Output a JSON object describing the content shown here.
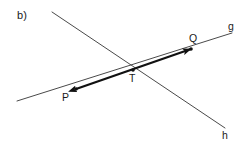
{
  "figure": {
    "part_label": "b)",
    "background_color": "#ffffff",
    "ink_color": "#262626",
    "thin_stroke_color": "#4a4a4a",
    "thick_stroke_color": "#111111",
    "width": 247,
    "height": 148
  },
  "chart_data": {
    "type": "diagram",
    "title": "b)",
    "xlabel": "",
    "ylabel": "",
    "xlim": [
      0,
      247
    ],
    "ylim": [
      148,
      0
    ],
    "grid": false,
    "legend": null,
    "lines": [
      {
        "name": "g",
        "label": "g",
        "style": "thin",
        "color": "#4a4a4a",
        "width": 1,
        "x1": 17,
        "y1": 101,
        "x2": 232,
        "y2": 33,
        "label_x": 228,
        "label_y": 21
      },
      {
        "name": "h",
        "label": "h",
        "style": "thin",
        "color": "#4a4a4a",
        "width": 1,
        "x1": 52,
        "y1": 12,
        "x2": 225,
        "y2": 128,
        "label_x": 222,
        "label_y": 130
      }
    ],
    "segments": [
      {
        "name": "PQ",
        "from": "P",
        "to": "Q",
        "style": "thick",
        "color": "#111111",
        "width": 2.2,
        "x1": 76,
        "y1": 89,
        "x2": 191,
        "y2": 49,
        "arrow_start": true,
        "arrow_end": true,
        "lies_on": "g"
      }
    ],
    "points": [
      {
        "name": "P",
        "label": "P",
        "x": 76,
        "y": 89,
        "label_x": 62,
        "label_y": 92,
        "marker": "dot"
      },
      {
        "name": "T",
        "label": "T",
        "x": 133,
        "y": 70,
        "label_x": 129,
        "label_y": 73,
        "marker": "dot"
      },
      {
        "name": "Q",
        "label": "Q",
        "x": 191,
        "y": 49,
        "label_x": 189,
        "label_y": 33,
        "marker": "dot"
      }
    ],
    "annotations": [
      {
        "name": "part-label",
        "text": "b)",
        "x": 17,
        "y": 10
      }
    ]
  }
}
